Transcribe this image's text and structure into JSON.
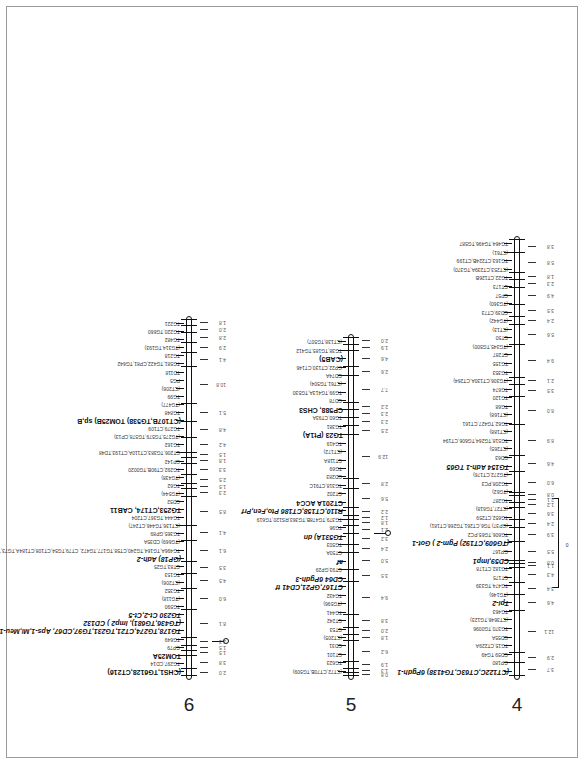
{
  "figure": {
    "type": "genetic linkage map",
    "chromosomes": [
      {
        "number": "6",
        "centromere_label": "0",
        "distances": [
          "2.0",
          "3.8",
          "1.5",
          "1.5",
          "2.3",
          "8.1",
          "6.0",
          "4.5",
          "3.5",
          "6.1",
          "4.1",
          "8.5",
          "2.3",
          "1.5",
          "2.5",
          "3.3",
          "1.8",
          "1.5",
          "4.2",
          "4.8",
          "5.1",
          "10.8",
          "4.1",
          "2.9",
          "2.8",
          "2.0",
          "1.8"
        ],
        "markers": [
          {
            "label": "(CHS1,TG6128,CT216)",
            "style": "bold-prefix"
          },
          {
            "label": "TG297,CD14",
            "style": "normal"
          },
          {
            "label": "TOM25A",
            "style": "bold"
          },
          {
            "label": "GP79",
            "style": "normal"
          },
          {
            "label": "TG649",
            "style": "normal"
          },
          {
            "label": "TG178,TG274,CT21,TG231,TG97,CD67, Aps-1,Mi,Meu-1,Cf-1",
            "style": "italic-suffix"
          },
          {
            "label": "(TG436,TG681), Imp2 ) CD132",
            "style": "italic-mid"
          },
          {
            "label": "TG230 Ct-2,Ct-5",
            "style": "italic-suffix"
          },
          {
            "label": "TG590",
            "style": "normal"
          },
          {
            "label": "(TG118)",
            "style": "normal"
          },
          {
            "label": "TG352",
            "style": "normal"
          },
          {
            "label": "(CT206)",
            "style": "normal"
          },
          {
            "label": "TG153",
            "style": "normal"
          },
          {
            "label": "CT83,TG25",
            "style": "normal"
          },
          {
            "label": "(GP18) Adh-2",
            "style": "italic-suffix"
          },
          {
            "label": "TG496A,TG164,TG240,CT58,TG177,TG472, CT79,TG54,CT108,CT184A,TG73,TG356",
            "style": "normal"
          },
          {
            "label": "(TG669) CD35A",
            "style": "normal"
          },
          {
            "label": "TG365,GP89",
            "style": "normal"
          },
          {
            "label": "(CT136,TG446,CT247)",
            "style": "normal"
          },
          {
            "label": "TG444,TG367,CT204",
            "style": "normal"
          },
          {
            "label": "TG253,CT174, CAB11",
            "style": "bold-suffix"
          },
          {
            "label": "CD52",
            "style": "normal"
          },
          {
            "label": "(TG544)",
            "style": "normal"
          },
          {
            "label": "TG62",
            "style": "normal"
          },
          {
            "label": "(TG438)",
            "style": "normal"
          },
          {
            "label": "TG292,CT90B,TG0020",
            "style": "normal"
          },
          {
            "label": "CP142",
            "style": "normal"
          },
          {
            "label": "CT206,TG383,CT110A,CT193,TD48",
            "style": "normal"
          },
          {
            "label": "TG162",
            "style": "normal"
          },
          {
            "label": "(TG275,TG579,TG578,CP13)",
            "style": "normal"
          },
          {
            "label": "TG279,CT109",
            "style": "normal"
          },
          {
            "label": "(CT107B,TG538) TOM25B) sp,B",
            "style": "bold-suffix"
          },
          {
            "label": "TG848",
            "style": "normal"
          },
          {
            "label": "(TG477)",
            "style": "normal"
          },
          {
            "label": "TG99",
            "style": "normal"
          },
          {
            "label": "(CT206)",
            "style": "normal"
          },
          {
            "label": "PG5",
            "style": "normal"
          },
          {
            "label": "TD118",
            "style": "normal"
          },
          {
            "label": "TG581,TG422,CP81,TG642",
            "style": "normal"
          },
          {
            "label": "TG218",
            "style": "normal"
          },
          {
            "label": "(TG314,TG193)",
            "style": "normal"
          },
          {
            "label": "TG482",
            "style": "normal"
          },
          {
            "label": "TG220,TG660",
            "style": "normal"
          },
          {
            "label": "TG221",
            "style": "normal"
          }
        ]
      },
      {
        "number": "5",
        "centromere_label": "0",
        "distances": [
          "0.8",
          "1.3",
          "1.9",
          "6.2",
          "1.8",
          "2.0",
          "3.8",
          "9.4",
          "3.5",
          "5.0",
          "2.4",
          "3.2",
          "2.1",
          "1.8",
          "1.2",
          "2.2",
          "5.6",
          "2.8",
          "12.9",
          "2.5",
          "2.3",
          "2.3",
          "2.2",
          "7.7",
          "2.6",
          "4.6",
          "1.9",
          "2.0"
        ],
        "markers": [
          {
            "label": "(CT72,CT70B,TG509)",
            "style": "normal"
          },
          {
            "label": "TG623",
            "style": "normal"
          },
          {
            "label": "CT101",
            "style": "normal"
          },
          {
            "label": "CD31",
            "style": "normal"
          },
          {
            "label": "(CT205)",
            "style": "normal"
          },
          {
            "label": "CT53",
            "style": "normal"
          },
          {
            "label": "CT242",
            "style": "normal"
          },
          {
            "label": "TG441",
            "style": "normal"
          },
          {
            "label": "(TG596)",
            "style": "normal"
          },
          {
            "label": "TG432",
            "style": "normal"
          },
          {
            "label": "CT167,GP21,CD41 tf",
            "style": "italic-suffix"
          },
          {
            "label": "CD64 6Pgdh-3",
            "style": "italic-suffix"
          },
          {
            "label": "CT93,GP29",
            "style": "normal"
          },
          {
            "label": "af",
            "style": "italic"
          },
          {
            "label": "CT50A",
            "style": "normal"
          },
          {
            "label": "TG503",
            "style": "normal"
          },
          {
            "label": "TG531A) dn",
            "style": "italic-suffix"
          },
          {
            "label": "TG96",
            "style": "normal"
          },
          {
            "label": "TG379,TG478B,TG363,RS120,TG619",
            "style": "normal"
          },
          {
            "label": "R110,CT158,CT186 Pto,Fen,Prf",
            "style": "italic-suffix"
          },
          {
            "label": "CT201A ACC4",
            "style": "bold-suffix"
          },
          {
            "label": "CT202",
            "style": "normal"
          },
          {
            "label": "TG318,CT91C",
            "style": "normal"
          },
          {
            "label": "CD283",
            "style": "normal"
          },
          {
            "label": "TG69",
            "style": "normal"
          },
          {
            "label": "CT118A",
            "style": "normal"
          },
          {
            "label": "(CT172)",
            "style": "normal"
          },
          {
            "label": "TG419",
            "style": "normal"
          },
          {
            "label": "TG23 (Pt1A)",
            "style": "bold-suffix"
          },
          {
            "label": "TG381",
            "style": "normal"
          },
          {
            "label": "TG60,CT93A",
            "style": "normal"
          },
          {
            "label": "CP588, CHS3",
            "style": "bold-suffix"
          },
          {
            "label": "CD78",
            "style": "normal"
          },
          {
            "label": "TG99,TG413A,TG530",
            "style": "normal"
          },
          {
            "label": "(CT61,TG504)",
            "style": "normal"
          },
          {
            "label": "CD74A",
            "style": "normal"
          },
          {
            "label": "GP22,CT130,CT146",
            "style": "normal"
          },
          {
            "label": "(CAB5)",
            "style": "bold"
          },
          {
            "label": "TG38,TG185,TG412",
            "style": "normal"
          },
          {
            "label": "(CT138,TG507)",
            "style": "normal"
          }
        ]
      },
      {
        "number": "4",
        "centromere_label": "0",
        "distances": [
          "3.7",
          "2.9",
          "12.1",
          "4.6",
          "3.4",
          "4.3",
          "1.1",
          "0.8",
          "5.5",
          "3.9",
          "2.4",
          "3.6",
          "1.2",
          "2.1",
          "0.8",
          "6.0",
          "4.6",
          "8.9",
          "8.0",
          "3.5",
          "2.1",
          "9.4",
          "5.6",
          "2.4",
          "3.5",
          "4.9",
          "2.3",
          "1.8",
          "5.8",
          "3.8"
        ],
        "markers": [
          {
            "label": "(CT122C,CT63C,TG4138) 6Pgdh-1",
            "style": "italic-suffix"
          },
          {
            "label": "GP180",
            "style": "normal"
          },
          {
            "label": "CD59 TG49",
            "style": "normal"
          },
          {
            "label": "TG15,CT229A",
            "style": "normal"
          },
          {
            "label": "CD55A",
            "style": "normal"
          },
          {
            "label": "TG370,TG0096",
            "style": "normal"
          },
          {
            "label": "(CT3646,TG123)",
            "style": "normal"
          },
          {
            "label": "TG463",
            "style": "normal"
          },
          {
            "label": "Tpi-2",
            "style": "italic"
          },
          {
            "label": "(TG146)",
            "style": "normal"
          },
          {
            "label": "TG474,TG339",
            "style": "normal"
          },
          {
            "label": "CT175",
            "style": "normal"
          },
          {
            "label": "TG182,CT178",
            "style": "normal"
          },
          {
            "label": "CD59,Imp1",
            "style": "italic-suffix"
          },
          {
            "label": "GP167",
            "style": "normal"
          },
          {
            "label": "(TG609,CT192) Pgm-2 ) Got-1",
            "style": "italic-suffix"
          },
          {
            "label": "TG606,TG65,PC2",
            "style": "normal"
          },
          {
            "label": "(GP37) TG6,CT261,TG266,CT181)",
            "style": "normal"
          },
          {
            "label": "TG652,CT259",
            "style": "normal"
          },
          {
            "label": "(CT27,TG618)",
            "style": "normal"
          },
          {
            "label": "TG287",
            "style": "normal"
          },
          {
            "label": "(TG62)",
            "style": "normal"
          },
          {
            "label": "TG208,PC3",
            "style": "normal"
          },
          {
            "label": "(TG272,CT176)",
            "style": "normal"
          },
          {
            "label": "TG154 Adh-1 TG65",
            "style": "italic-mid"
          },
          {
            "label": "CD63",
            "style": "normal"
          },
          {
            "label": "(CT265)",
            "style": "normal"
          },
          {
            "label": "TG518,TG264,TG606,CT194",
            "style": "normal"
          },
          {
            "label": "(CT188)",
            "style": "normal"
          },
          {
            "label": "TG62,TG427,CT161",
            "style": "normal"
          },
          {
            "label": "(CT168)",
            "style": "normal"
          },
          {
            "label": "TG68",
            "style": "normal"
          },
          {
            "label": "TG120",
            "style": "normal"
          },
          {
            "label": "TG674",
            "style": "normal"
          },
          {
            "label": "(TG306,CT130A,CT264)",
            "style": "normal"
          },
          {
            "label": "TG353",
            "style": "normal"
          },
          {
            "label": "TG155",
            "style": "normal"
          },
          {
            "label": "CT287",
            "style": "normal"
          },
          {
            "label": "(TG345,TG500)",
            "style": "normal"
          },
          {
            "label": "CT50",
            "style": "normal"
          },
          {
            "label": "(CT13)",
            "style": "normal"
          },
          {
            "label": "(TG442)",
            "style": "normal"
          },
          {
            "label": "CD39,CT73",
            "style": "normal"
          },
          {
            "label": "(TG360)",
            "style": "normal"
          },
          {
            "label": "CP57",
            "style": "normal"
          },
          {
            "label": "CT173",
            "style": "normal"
          },
          {
            "label": "TG22,CT126B",
            "style": "normal"
          },
          {
            "label": "(CT253,CT239A,TG370)",
            "style": "normal"
          },
          {
            "label": "TG163,CT224B,CT199",
            "style": "normal"
          },
          {
            "label": "(CT61)",
            "style": "normal"
          },
          {
            "label": "TG464,TG496,TG587",
            "style": "normal"
          }
        ]
      }
    ]
  }
}
